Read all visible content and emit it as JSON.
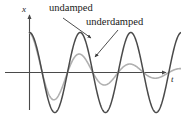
{
  "figure": {
    "title": "",
    "axes": {
      "y_axis_label": "x",
      "x_axis_label": "t"
    },
    "annotations": {
      "undamped_label": "undamped",
      "underdamped_label": "underdamped"
    },
    "colors": {
      "undamped_curve": "#4a4a4a",
      "underdamped_curve": "#b0b0b0",
      "axis": "#4a4a4a",
      "text": "#1a1a1a",
      "background": "#ffffff"
    }
  },
  "chart_data": {
    "type": "line",
    "title": "",
    "xlabel": "t",
    "ylabel": "x",
    "grid": false,
    "legend": "inline-annotations",
    "xlim": [
      0,
      3.0
    ],
    "ylim": [
      -1.15,
      1.15
    ],
    "axis_origin_px": {
      "x": 29,
      "y": 72
    },
    "series": [
      {
        "name": "undamped",
        "label": "undamped",
        "color": "#4a4a4a",
        "form": "x(t) = A cos(omega t)",
        "amplitude": 1.0,
        "decay_rate": 0.0,
        "period": 1.0,
        "phase": 0.0,
        "x": [
          0.0,
          0.125,
          0.25,
          0.375,
          0.5,
          0.625,
          0.75,
          0.875,
          1.0,
          1.125,
          1.25,
          1.375,
          1.5,
          1.625,
          1.75,
          1.875,
          2.0,
          2.125,
          2.25,
          2.375,
          2.5,
          2.625,
          2.75,
          2.875,
          3.0
        ],
        "y": [
          1.0,
          0.707,
          0.0,
          -0.707,
          -1.0,
          -0.707,
          0.0,
          0.707,
          1.0,
          0.707,
          0.0,
          -0.707,
          -1.0,
          -0.707,
          0.0,
          0.707,
          1.0,
          0.707,
          0.0,
          -0.707,
          -1.0,
          -0.707,
          0.0,
          0.707,
          1.0
        ]
      },
      {
        "name": "underdamped",
        "label": "underdamped",
        "color": "#b0b0b0",
        "form": "x(t) = A e^(-bt) cos(omega t)",
        "amplitude": 1.0,
        "decay_rate": 0.78,
        "period": 1.0,
        "phase": 0.0,
        "x": [
          0.0,
          0.125,
          0.25,
          0.375,
          0.5,
          0.625,
          0.75,
          0.875,
          1.0,
          1.125,
          1.25,
          1.375,
          1.5,
          1.625,
          1.75,
          1.875,
          2.0,
          2.125,
          2.25,
          2.375,
          2.5,
          2.625,
          2.75,
          2.875,
          3.0
        ],
        "y": [
          1.0,
          0.641,
          0.0,
          -0.531,
          -0.677,
          -0.441,
          0.0,
          0.365,
          0.459,
          0.299,
          0.0,
          -0.247,
          -0.311,
          -0.203,
          0.0,
          0.168,
          0.211,
          0.137,
          0.0,
          -0.114,
          -0.143,
          -0.093,
          0.0,
          0.077,
          0.097
        ]
      }
    ],
    "annotations": [
      {
        "text": "undamped",
        "points_to_series": "undamped",
        "label_px": {
          "x": 49,
          "y": 3
        },
        "arrow_from_px": {
          "x": 63,
          "y": 18
        },
        "arrow_to_px": {
          "x": 91,
          "y": 38
        }
      },
      {
        "text": "underdamped",
        "points_to_series": "underdamped",
        "label_px": {
          "x": 86,
          "y": 17
        },
        "arrow_from_px": {
          "x": 118,
          "y": 30
        },
        "arrow_to_px": {
          "x": 95,
          "y": 57
        }
      }
    ]
  }
}
